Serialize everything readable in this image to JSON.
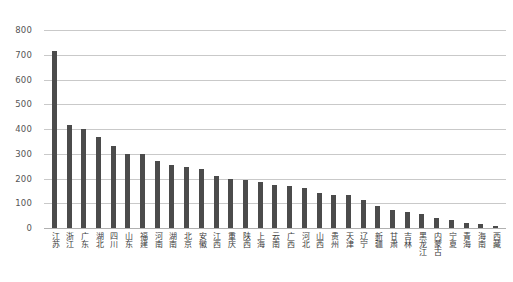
{
  "chart_data": {
    "type": "bar",
    "title": "",
    "subtitle": "",
    "xlabel": "",
    "ylabel": "",
    "ylim": [
      0,
      800
    ],
    "yticks": [
      0,
      100,
      200,
      300,
      400,
      500,
      600,
      700,
      800
    ],
    "ytick_labels": [
      "0",
      "100",
      "200",
      "300",
      "400",
      "500",
      "600",
      "700",
      "800"
    ],
    "grid": true,
    "legend": "none",
    "bar_color": "#4b4b4b",
    "grid_color": "#c9c9c9",
    "categories": [
      "江苏",
      "浙江",
      "广东",
      "湖北",
      "四川",
      "山东",
      "福建",
      "河南",
      "湖南",
      "北京",
      "安徽",
      "江西",
      "重庆",
      "陕西",
      "上海",
      "云南",
      "广西",
      "河北",
      "山西",
      "贵州",
      "天津",
      "辽宁",
      "新疆",
      "甘肃",
      "吉林",
      "黑龙江",
      "内蒙古",
      "宁夏",
      "青海",
      "海南",
      "西藏"
    ],
    "values": [
      715,
      415,
      400,
      367,
      330,
      300,
      300,
      272,
      253,
      245,
      240,
      210,
      200,
      195,
      185,
      175,
      170,
      160,
      140,
      135,
      132,
      115,
      90,
      72,
      65,
      58,
      42,
      33,
      22,
      15,
      10
    ]
  }
}
